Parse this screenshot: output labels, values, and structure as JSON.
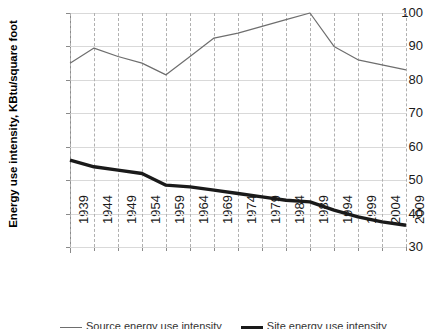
{
  "chart_data": {
    "type": "line",
    "title": "",
    "xlabel": "",
    "ylabel": "Energy use intensity, KBtu/square foot",
    "categories": [
      "1939",
      "1944",
      "1949",
      "1954",
      "1959",
      "1964",
      "1969",
      "1974",
      "1979",
      "1984",
      "1989",
      "1994",
      "1999",
      "2004",
      "2009"
    ],
    "ylim": [
      30,
      100
    ],
    "yticks": [
      30,
      40,
      50,
      60,
      70,
      80,
      90,
      100
    ],
    "xlim": [
      "1939",
      "2009"
    ],
    "grid": "horizontal solid gray, vertical dashed gray",
    "legend_position": "below-plot",
    "series": [
      {
        "name": "Source energy use intensity",
        "style": "thin gray line",
        "color": "#6e6e6e",
        "values": [
          85,
          89.5,
          87,
          85,
          81.5,
          87,
          92.5,
          94,
          96,
          98,
          100,
          90,
          86,
          84.5,
          83
        ]
      },
      {
        "name": "Site energy use intensity",
        "style": "thick black line",
        "color": "#1a1a1a",
        "values": [
          56,
          54,
          53,
          52,
          48.5,
          48,
          47,
          46,
          45,
          44,
          43.5,
          41,
          39,
          37.5,
          36.5
        ]
      }
    ]
  },
  "legend": {
    "items": [
      {
        "label": "Source energy use intensity"
      },
      {
        "label": "Site energy use intensity"
      }
    ]
  }
}
